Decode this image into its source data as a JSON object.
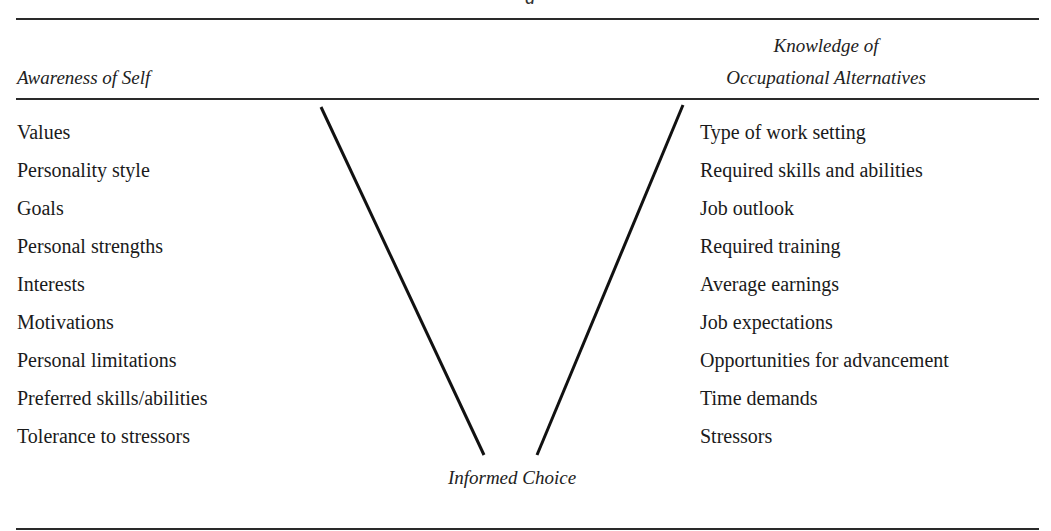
{
  "figure": {
    "title_remnant": "g",
    "left_column": {
      "header": "Awareness of Self",
      "items": [
        "Values",
        "Personality style",
        "Goals",
        "Personal strengths",
        "Interests",
        "Motivations",
        "Personal limitations",
        "Preferred skills/abilities",
        "Tolerance to stressors"
      ]
    },
    "right_column": {
      "header_line1": "Knowledge of",
      "header_line2": "Occupational Alternatives",
      "items": [
        "Type of work setting",
        "Required skills and abilities",
        "Job outlook",
        "Required training",
        "Average earnings",
        "Job expectations",
        "Opportunities for advancement",
        "Time demands",
        "Stressors"
      ]
    },
    "outcome": "Informed Choice",
    "colors": {
      "rule": "#2a2a2a",
      "text": "#1a1a1a",
      "background": "#ffffff"
    }
  }
}
